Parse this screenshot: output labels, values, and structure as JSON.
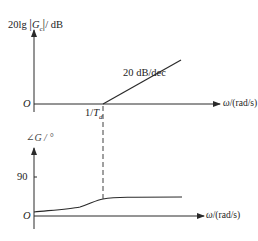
{
  "magnitude_plot": {
    "ylabel_prefix": "20lg",
    "ylabel_var": "G",
    "ylabel_sub": "c",
    "ylabel_unit": "/ dB",
    "origin": "O",
    "xlabel_var": "ω",
    "xlabel_unit": "/(rad/s)",
    "slope_label": "20 dB/dec",
    "corner_label_num": "1/",
    "corner_label_var": "T",
    "corner_label_sub": "d"
  },
  "phase_plot": {
    "ylabel": "∠G / °",
    "origin": "O",
    "tick_90": "90",
    "xlabel_var": "ω",
    "xlabel_unit": "/(rad/s)"
  },
  "colors": {
    "line": "#2a2a2a",
    "background": "#ffffff"
  }
}
